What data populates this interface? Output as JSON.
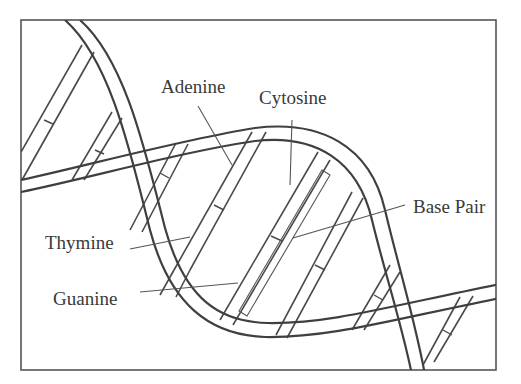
{
  "figure": {
    "type": "DNA double helix schematic",
    "stroke_color": "#3f3f3f",
    "background": "#ffffff"
  },
  "labels": {
    "adenine": "Adenine",
    "cytosine": "Cytosine",
    "base_pair": "Base Pair",
    "thymine": "Thymine",
    "guanine": "Guanine"
  }
}
